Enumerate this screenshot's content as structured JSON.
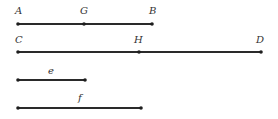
{
  "diagram": {
    "lines": [
      {
        "id": "AB",
        "x1": 18,
        "x2": 152,
        "y": 24,
        "points": [
          {
            "label": "A",
            "x": 18,
            "lx": 15,
            "ly": 14
          },
          {
            "label": "G",
            "x": 84,
            "lx": 80,
            "ly": 14
          },
          {
            "label": "B",
            "x": 152,
            "lx": 149,
            "ly": 14
          }
        ]
      },
      {
        "id": "CD",
        "x1": 18,
        "x2": 261,
        "y": 52,
        "points": [
          {
            "label": "C",
            "x": 18,
            "lx": 15,
            "ly": 43
          },
          {
            "label": "H",
            "x": 139,
            "lx": 134,
            "ly": 43
          },
          {
            "label": "D",
            "x": 261,
            "lx": 256,
            "ly": 43
          }
        ]
      },
      {
        "id": "e",
        "x1": 18,
        "x2": 85,
        "y": 80,
        "label": "e",
        "lx": 48,
        "ly": 74,
        "points": [
          {
            "label": "",
            "x": 18
          },
          {
            "label": "",
            "x": 85
          }
        ]
      },
      {
        "id": "f",
        "x1": 18,
        "x2": 141,
        "y": 108,
        "label": "f",
        "lx": 78,
        "ly": 101,
        "points": [
          {
            "label": "",
            "x": 18
          },
          {
            "label": "",
            "x": 141
          }
        ]
      }
    ],
    "labels": {
      "A": "A",
      "G": "G",
      "B": "B",
      "C": "C",
      "H": "H",
      "D": "D",
      "e": "e",
      "f": "f"
    }
  }
}
